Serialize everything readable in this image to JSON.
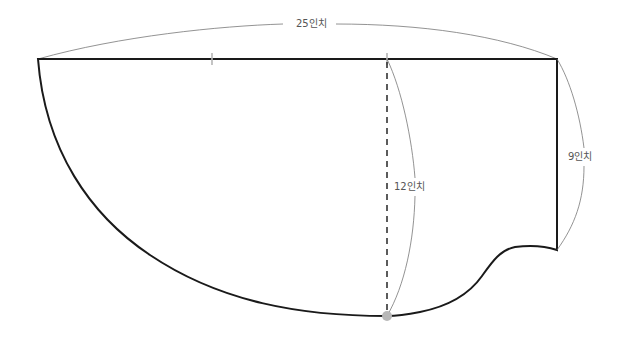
{
  "diagram": {
    "type": "sewing pattern",
    "colors": {
      "outline": "#1a1a1a",
      "dimension_line": "#777777",
      "tick_mark": "#b5b5b5",
      "marker_dot": "#b8b8b8",
      "dashed_line": "#333333"
    },
    "labels": {
      "width": "25인치",
      "center_length": "12인치",
      "side_length": "9인치"
    }
  }
}
